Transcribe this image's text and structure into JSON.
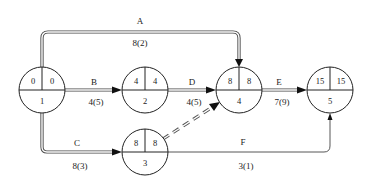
{
  "diagram": {
    "type": "activity-on-arrow network (time-scaled node diagram)",
    "nodes": [
      {
        "id": "1",
        "es": "0",
        "ls": "0"
      },
      {
        "id": "2",
        "es": "4",
        "ls": "4"
      },
      {
        "id": "3",
        "es": "8",
        "ls": "8"
      },
      {
        "id": "4",
        "es": "8",
        "ls": "8"
      },
      {
        "id": "5",
        "es": "15",
        "ls": "15"
      }
    ],
    "activities": [
      {
        "name": "A",
        "duration": "8(2)",
        "from": "1",
        "to": "4"
      },
      {
        "name": "B",
        "duration": "4(5)",
        "from": "1",
        "to": "2"
      },
      {
        "name": "C",
        "duration": "8(3)",
        "from": "1",
        "to": "3"
      },
      {
        "name": "D",
        "duration": "4(5)",
        "from": "2",
        "to": "4"
      },
      {
        "name": "E",
        "duration": "7(9)",
        "from": "4",
        "to": "5"
      },
      {
        "name": "F",
        "duration": "3(1)",
        "from": "3",
        "to": "5"
      }
    ],
    "dummy": {
      "from": "3",
      "to": "4",
      "style": "dashed"
    }
  }
}
